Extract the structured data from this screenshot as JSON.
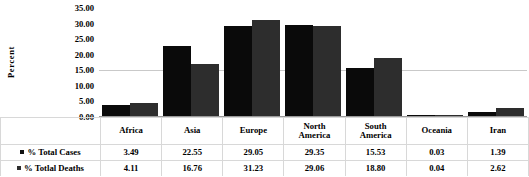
{
  "chart_data": {
    "type": "bar",
    "title": "",
    "subtitle": "",
    "xlabel": "",
    "ylabel": "Percent",
    "ylim": [
      0,
      35
    ],
    "ytick_step": 5,
    "yticks": [
      "35.00",
      "30.00",
      "25.00",
      "20.00",
      "15.00",
      "10.00",
      "5.00",
      "0.00"
    ],
    "ytick_values": [
      35,
      30,
      25,
      20,
      15,
      10,
      5,
      0
    ],
    "grid": "horizontal-faint",
    "legend_position": "left-table-row-headers",
    "categories": [
      "Africa",
      "Asia",
      "Europe",
      "North America",
      "South America",
      "Oceania",
      "Iran"
    ],
    "category_lines": [
      [
        "Africa"
      ],
      [
        "Asia"
      ],
      [
        "Europe"
      ],
      [
        "North",
        "America"
      ],
      [
        "South",
        "America"
      ],
      [
        "Oceania"
      ],
      [
        "Iran"
      ]
    ],
    "series": [
      {
        "name": "% Total Cases",
        "color": "#0a0a0a",
        "values": [
          3.49,
          22.55,
          29.05,
          29.35,
          15.53,
          0.03,
          1.39
        ],
        "labels": [
          "3.49",
          "22.55",
          "29.05",
          "29.35",
          "15.53",
          "0.03",
          "1.39"
        ]
      },
      {
        "name": "% Totlal Deaths",
        "color": "#2d2d2d",
        "values": [
          4.11,
          16.76,
          31.23,
          29.06,
          18.8,
          0.04,
          2.62
        ],
        "labels": [
          "4.11",
          "16.76",
          "31.23",
          "29.06",
          "18.80",
          "0.04",
          "2.62"
        ]
      }
    ]
  },
  "colors": {
    "series_cases": "#0a0a0a",
    "series_deaths": "#2d2d2d",
    "gridline": "#c9c9c9",
    "table_border": "#d8d8d8",
    "background": "#ffffff",
    "text": "#000000"
  }
}
